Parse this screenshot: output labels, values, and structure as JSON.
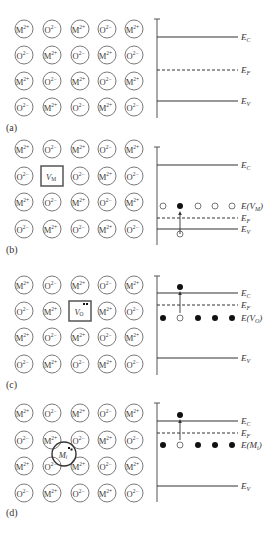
{
  "figure": {
    "width": 279,
    "height": 539,
    "colors": {
      "line": "#333333",
      "circle_stroke": "#6b6b6b",
      "filled_dot": "#111111"
    },
    "lattice": {
      "col_x": [
        24,
        52,
        80,
        107,
        134
      ],
      "radius": 9,
      "pattern": [
        [
          "M",
          "O",
          "M",
          "O",
          "M"
        ],
        [
          "O",
          "M",
          "O",
          "M",
          "O"
        ],
        [
          "M",
          "O",
          "M",
          "O",
          "M"
        ],
        [
          "O",
          "M",
          "O",
          "M",
          "O"
        ]
      ],
      "ion_labels": {
        "M": "M",
        "O": "O"
      },
      "ion_charges": {
        "M": "2+",
        "O": "2−"
      }
    },
    "band_axis": {
      "x": 157,
      "line_end_x": 238,
      "label_x": 241
    },
    "level_labels": {
      "EC": {
        "main": "E",
        "sub": "C"
      },
      "EF": {
        "main": "E",
        "sub": "F"
      },
      "EV": {
        "main": "E",
        "sub": "V"
      }
    },
    "panels": [
      {
        "id": "a",
        "label": "(a)",
        "label_y": 128,
        "row_y": [
          29,
          55,
          81,
          107
        ],
        "defect": null,
        "axis_top": 19,
        "axis_bottom": 118,
        "EC_y": 37,
        "EF_y": 70,
        "EV_y": 101,
        "defect_level": null
      },
      {
        "id": "b",
        "label": "(b)",
        "label_y": 250,
        "row_y": [
          149,
          176,
          202,
          229
        ],
        "defect": {
          "type": "box",
          "row": 1,
          "col": 1,
          "main": "V",
          "sub": "M",
          "dots": 0
        },
        "axis_top": 147,
        "axis_bottom": 245,
        "EC_y": 165,
        "EF_y": 218,
        "EV_y": 229,
        "defect_level": {
          "y": 206,
          "label_main": "E(V",
          "label_sub": "M",
          "label_end": ")",
          "dot_x": [
            163,
            180,
            198,
            215,
            232
          ],
          "dots": [
            "empty",
            "filled",
            "empty",
            "empty",
            "empty"
          ],
          "arrow": {
            "x": 180,
            "from_y": 234,
            "to_y": 211,
            "source_dot_y": 234,
            "source_dot": "empty"
          }
        }
      },
      {
        "id": "c",
        "label": "(c)",
        "label_y": 385,
        "row_y": [
          285,
          311,
          337,
          364
        ],
        "defect": {
          "type": "box",
          "row": 1,
          "col": 2,
          "main": "V",
          "sub": "O",
          "dots": 2
        },
        "axis_top": 276,
        "axis_bottom": 375,
        "EC_y": 293,
        "EF_y": 305,
        "EV_y": 358,
        "defect_level": {
          "y": 318,
          "label_main": "E(V",
          "label_sub": "O",
          "label_end": ")",
          "dot_x": [
            163,
            180,
            198,
            215,
            232
          ],
          "dots": [
            "filled",
            "empty",
            "filled",
            "filled",
            "filled"
          ],
          "arrow": {
            "x": 180,
            "from_y": 313,
            "to_y": 291,
            "source_dot_y": 287,
            "source_dot": "filled"
          }
        }
      },
      {
        "id": "d",
        "label": "(d)",
        "label_y": 513,
        "row_y": [
          413,
          440,
          466,
          493
        ],
        "defect": {
          "type": "interstitial",
          "cx": 64,
          "cy": 454,
          "r": 12,
          "main": "M",
          "sub": "i",
          "dots": 2
        },
        "axis_top": 403,
        "axis_bottom": 502,
        "EC_y": 421,
        "EF_y": 433,
        "EV_y": 486,
        "defect_level": {
          "y": 445,
          "label_main": "E(M",
          "label_sub": "i",
          "label_end": ")",
          "dot_x": [
            163,
            180,
            198,
            215,
            232
          ],
          "dots": [
            "filled",
            "empty",
            "filled",
            "filled",
            "filled"
          ],
          "arrow": {
            "x": 180,
            "from_y": 440,
            "to_y": 419,
            "source_dot_y": 415,
            "source_dot": "filled"
          }
        }
      }
    ]
  }
}
